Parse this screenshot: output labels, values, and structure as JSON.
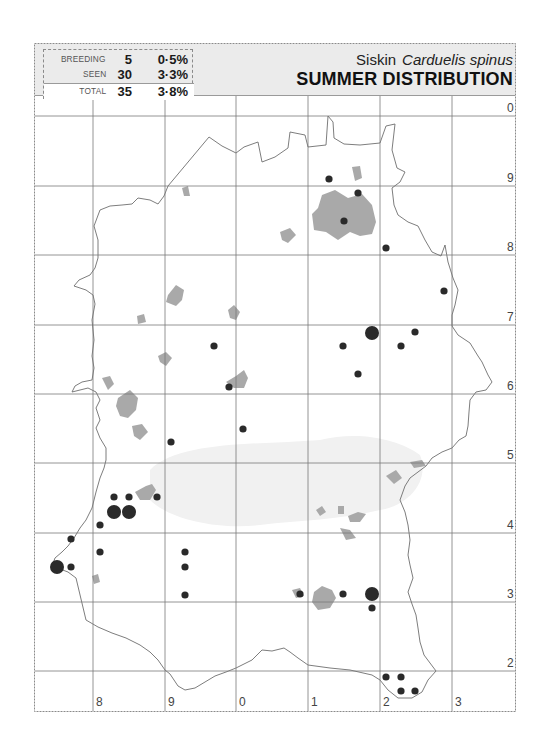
{
  "header": {
    "common_name": "Siskin",
    "scientific_name": "Carduelis spinus",
    "subtitle": "SUMMER DISTRIBUTION"
  },
  "stats": {
    "breeding": {
      "label": "BREEDING",
      "count": "5",
      "percent": "0·5%"
    },
    "seen": {
      "label": "SEEN",
      "count": "30",
      "percent": "3·3%"
    },
    "total": {
      "label": "TOTAL",
      "count": "35",
      "percent": "3·8%"
    }
  },
  "grid": {
    "x_labels": [
      "8",
      "9",
      "0",
      "1",
      "2",
      "3"
    ],
    "y_labels": [
      "0",
      "9",
      "8",
      "7",
      "6",
      "5",
      "4",
      "3",
      "2"
    ]
  },
  "colors": {
    "dot": "#2a2a2a",
    "urban": "#a9a9a9",
    "grid": "#7a7a7a",
    "outline": "#6e6e6e",
    "header_bg": "#ebebeb"
  },
  "legend": {
    "large_dot": "breeding",
    "small_dot": "seen"
  },
  "records": [
    {
      "x": 329,
      "y": 179,
      "type": "seen"
    },
    {
      "x": 358,
      "y": 193,
      "type": "seen"
    },
    {
      "x": 344,
      "y": 221,
      "type": "seen"
    },
    {
      "x": 386,
      "y": 248,
      "type": "seen"
    },
    {
      "x": 444,
      "y": 291,
      "type": "seen"
    },
    {
      "x": 372,
      "y": 333,
      "type": "breeding"
    },
    {
      "x": 415,
      "y": 332,
      "type": "seen"
    },
    {
      "x": 343,
      "y": 346,
      "type": "seen"
    },
    {
      "x": 401,
      "y": 346,
      "type": "seen"
    },
    {
      "x": 214,
      "y": 346,
      "type": "seen"
    },
    {
      "x": 358,
      "y": 374,
      "type": "seen"
    },
    {
      "x": 229,
      "y": 387,
      "type": "seen"
    },
    {
      "x": 243,
      "y": 429,
      "type": "seen"
    },
    {
      "x": 171,
      "y": 442,
      "type": "seen"
    },
    {
      "x": 114,
      "y": 497,
      "type": "seen"
    },
    {
      "x": 129,
      "y": 497,
      "type": "seen"
    },
    {
      "x": 157,
      "y": 497,
      "type": "seen"
    },
    {
      "x": 114,
      "y": 512,
      "type": "breeding"
    },
    {
      "x": 129,
      "y": 512,
      "type": "breeding"
    },
    {
      "x": 100,
      "y": 525,
      "type": "seen"
    },
    {
      "x": 71,
      "y": 539,
      "type": "seen"
    },
    {
      "x": 100,
      "y": 552,
      "type": "seen"
    },
    {
      "x": 185,
      "y": 552,
      "type": "seen"
    },
    {
      "x": 57,
      "y": 567,
      "type": "breeding"
    },
    {
      "x": 71,
      "y": 567,
      "type": "seen"
    },
    {
      "x": 185,
      "y": 567,
      "type": "seen"
    },
    {
      "x": 185,
      "y": 595,
      "type": "seen"
    },
    {
      "x": 300,
      "y": 594,
      "type": "seen"
    },
    {
      "x": 343,
      "y": 594,
      "type": "seen"
    },
    {
      "x": 372,
      "y": 594,
      "type": "breeding"
    },
    {
      "x": 372,
      "y": 608,
      "type": "seen"
    },
    {
      "x": 386,
      "y": 677,
      "type": "seen"
    },
    {
      "x": 401,
      "y": 677,
      "type": "seen"
    },
    {
      "x": 401,
      "y": 691,
      "type": "seen"
    },
    {
      "x": 415,
      "y": 691,
      "type": "seen"
    }
  ]
}
